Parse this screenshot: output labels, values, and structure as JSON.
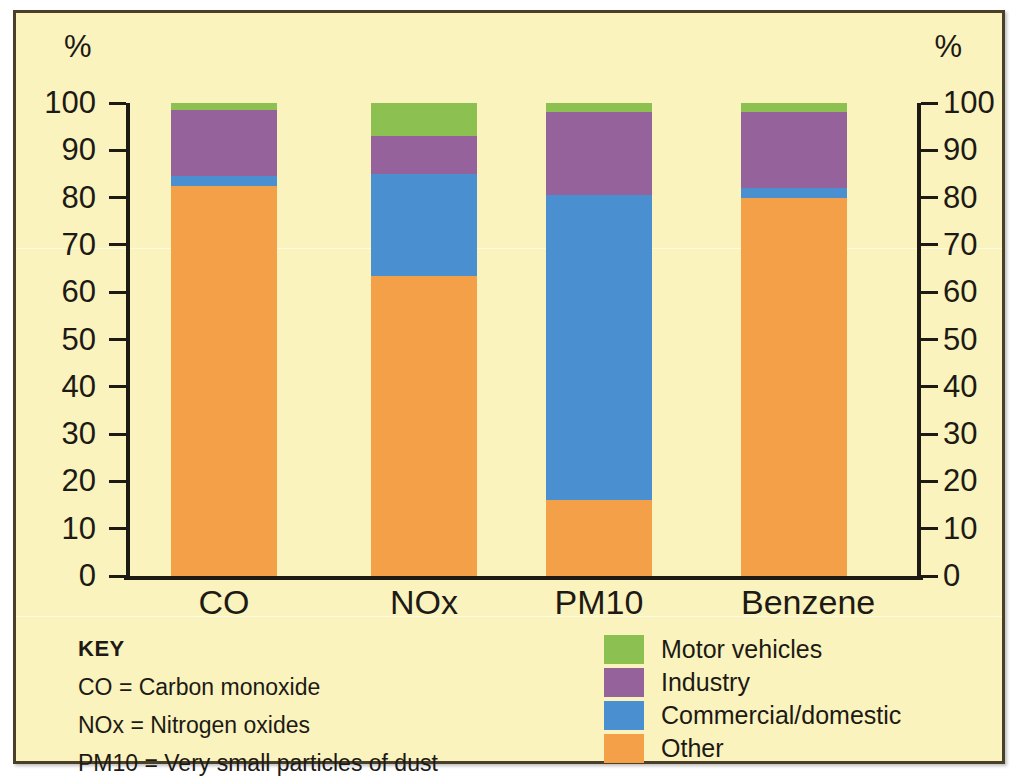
{
  "chart_data": {
    "type": "bar",
    "subtype": "stacked-100-percent",
    "title": "",
    "xlabel": "",
    "ylabel": "%",
    "ylabel_right": "%",
    "ylim": [
      0,
      100
    ],
    "yticks": [
      0,
      10,
      20,
      30,
      40,
      50,
      60,
      70,
      80,
      90,
      100
    ],
    "ytick_labels": [
      "0",
      "10",
      "20",
      "30",
      "40",
      "50",
      "60",
      "70",
      "80",
      "90",
      "100"
    ],
    "grid": false,
    "legend_position": "bottom-right",
    "categories": [
      "CO",
      "NOx",
      "PM10",
      "Benzene"
    ],
    "series": [
      {
        "name": "Motor vehicles",
        "color": "#8cc152",
        "values": [
          1.5,
          7.0,
          2.0,
          2.0
        ]
      },
      {
        "name": "Industry",
        "color": "#96629b",
        "values": [
          14.0,
          8.0,
          17.5,
          16.0
        ]
      },
      {
        "name": "Commercial/domestic",
        "color": "#4a90d0",
        "values": [
          2.0,
          21.6,
          64.5,
          2.0
        ]
      },
      {
        "name": "Other",
        "color": "#f4a049",
        "values": [
          82.5,
          63.4,
          16.0,
          80.0
        ]
      }
    ],
    "colors": {
      "background": "#faf3be",
      "frame": "#4a3f28",
      "axis": "#1d1a14",
      "motor_vehicles": "#8cc152",
      "industry": "#96629b",
      "commercial_domestic": "#4a90d0",
      "other": "#f4a049"
    }
  },
  "axis": {
    "unit_left": "%",
    "unit_right": "%"
  },
  "key": {
    "title": "KEY",
    "lines": [
      "CO = Carbon monoxide",
      "NOx = Nitrogen oxides",
      "PM10 = Very small particles of dust"
    ]
  },
  "legend": {
    "items": [
      {
        "label": "Motor vehicles",
        "color": "#8cc152"
      },
      {
        "label": "Industry",
        "color": "#96629b"
      },
      {
        "label": "Commercial/domestic",
        "color": "#4a90d0"
      },
      {
        "label": "Other",
        "color": "#f4a049"
      }
    ]
  }
}
